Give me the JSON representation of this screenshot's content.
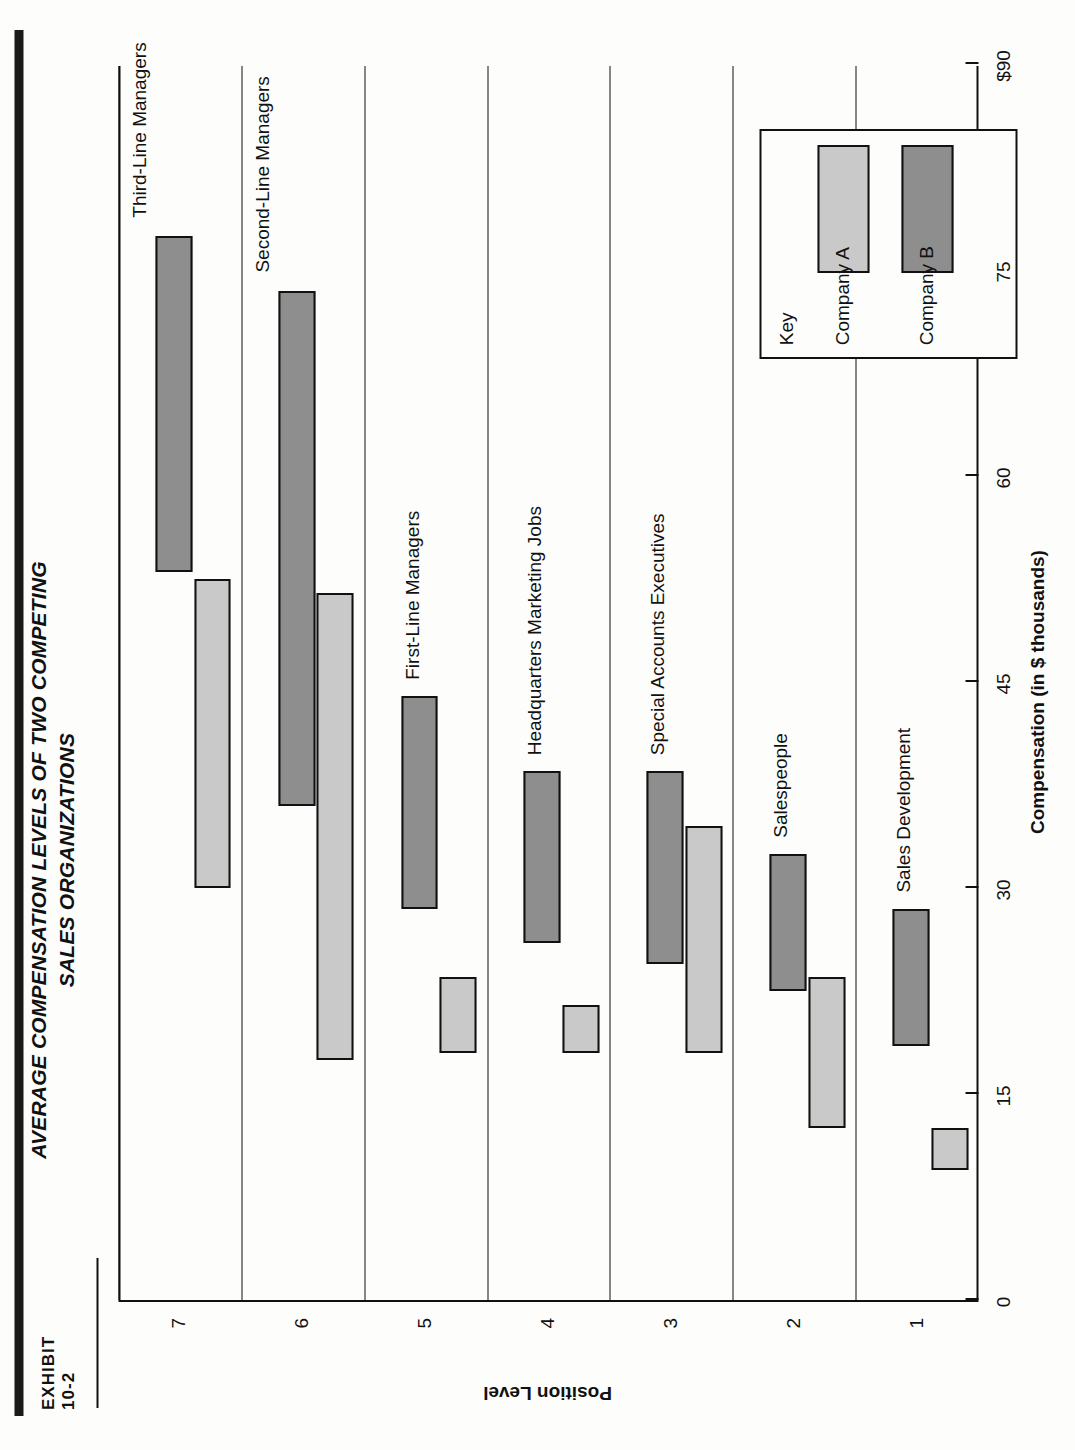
{
  "exhibit": {
    "label": "EXHIBIT",
    "number": "10-2"
  },
  "title": {
    "line1": "AVERAGE COMPENSATION LEVELS OF TWO COMPETING",
    "line2": "SALES ORGANIZATIONS"
  },
  "legend": {
    "title": "Key",
    "items": [
      {
        "label": "Company A",
        "color": "#c9c9c9",
        "series": "a"
      },
      {
        "label": "Company B",
        "color": "#8e8e8e",
        "series": "b"
      }
    ]
  },
  "axes": {
    "x_label": "Compensation (in $ thousands)",
    "x_ticks": [
      "0",
      "15",
      "30",
      "45",
      "60",
      "75",
      "$90"
    ],
    "y_label": "Position Level",
    "y_ticks": [
      "1",
      "2",
      "3",
      "4",
      "5",
      "6",
      "7"
    ]
  },
  "chart_data": {
    "type": "bar",
    "orientation": "horizontal-range",
    "title": "AVERAGE COMPENSATION LEVELS OF TWO COMPETING SALES ORGANIZATIONS",
    "xlabel": "Compensation (in $ thousands)",
    "ylabel": "Position Level",
    "xlim": [
      0,
      90
    ],
    "xticks": [
      0,
      15,
      30,
      45,
      60,
      75,
      90
    ],
    "grid": false,
    "legend_position": "inside-lower-right",
    "categories": [
      "1",
      "2",
      "3",
      "4",
      "5",
      "6",
      "7"
    ],
    "category_names": [
      "Sales Development",
      "Salespeople",
      "Special Accounts Executives",
      "Headquarters Marketing Jobs",
      "First-Line Managers",
      "Second-Line Managers",
      "Third-Line Managers"
    ],
    "series": [
      {
        "name": "Company A",
        "color": "#c9c9c9",
        "ranges": [
          {
            "level": "1",
            "low": 9.5,
            "high": 12.5
          },
          {
            "level": "2",
            "low": 12.5,
            "high": 23.5
          },
          {
            "level": "3",
            "low": 18.0,
            "high": 34.5
          },
          {
            "level": "4",
            "low": 18.0,
            "high": 21.5
          },
          {
            "level": "5",
            "low": 18.0,
            "high": 23.5
          },
          {
            "level": "6",
            "low": 17.5,
            "high": 51.5
          },
          {
            "level": "7",
            "low": 30.0,
            "high": 52.5
          }
        ]
      },
      {
        "name": "Company B",
        "color": "#8e8e8e",
        "ranges": [
          {
            "level": "1",
            "low": 18.5,
            "high": 28.5
          },
          {
            "level": "2",
            "low": 22.5,
            "high": 32.5
          },
          {
            "level": "3",
            "low": 24.5,
            "high": 38.5
          },
          {
            "level": "4",
            "low": 26.0,
            "high": 38.5
          },
          {
            "level": "5",
            "low": 28.5,
            "high": 44.0
          },
          {
            "level": "6",
            "low": 36.0,
            "high": 73.5
          },
          {
            "level": "7",
            "low": 53.0,
            "high": 77.5
          }
        ]
      }
    ]
  }
}
